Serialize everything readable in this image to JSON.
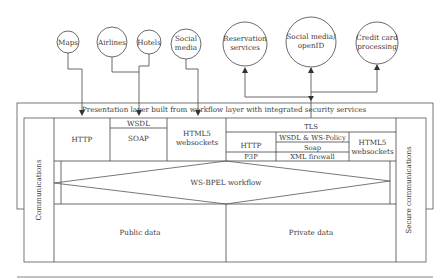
{
  "external_services": {
    "maps": "Maps",
    "airlines": "Airlines",
    "hotels": "Hotels",
    "social_media_l1": "Social",
    "social_media_l2": "media",
    "reservation_l1": "Reservation",
    "reservation_l2": "services",
    "openid_l1": "Social media/",
    "openid_l2": "openID",
    "credit_l1": "Credit card",
    "credit_l2": "processing"
  },
  "presentation_layer": {
    "title": "Presentation layer built from workflow layer with integrated security services"
  },
  "left_side": {
    "communications": "Communications",
    "http": "HTTP",
    "wsdl": "WSDL",
    "soap": "SOAP",
    "html5_l1": "HTML5",
    "html5_l2": "websockets",
    "public_data": "Public data"
  },
  "right_side": {
    "tls": "TLS",
    "http": "HTTP",
    "p3p": "P3P",
    "wsdl_policy": "WSDL & WS-Policy",
    "soap": "Soap",
    "xml_firewall": "XML firewall",
    "html5_l1": "HTML5",
    "html5_l2": "websockets",
    "secure_communications": "Secure communications",
    "private_data": "Private data"
  },
  "workflow": {
    "label": "WS-BPEL workflow"
  },
  "colors": {
    "line": "#444444",
    "text": "#3a3a3a",
    "background": "#ffffff"
  }
}
